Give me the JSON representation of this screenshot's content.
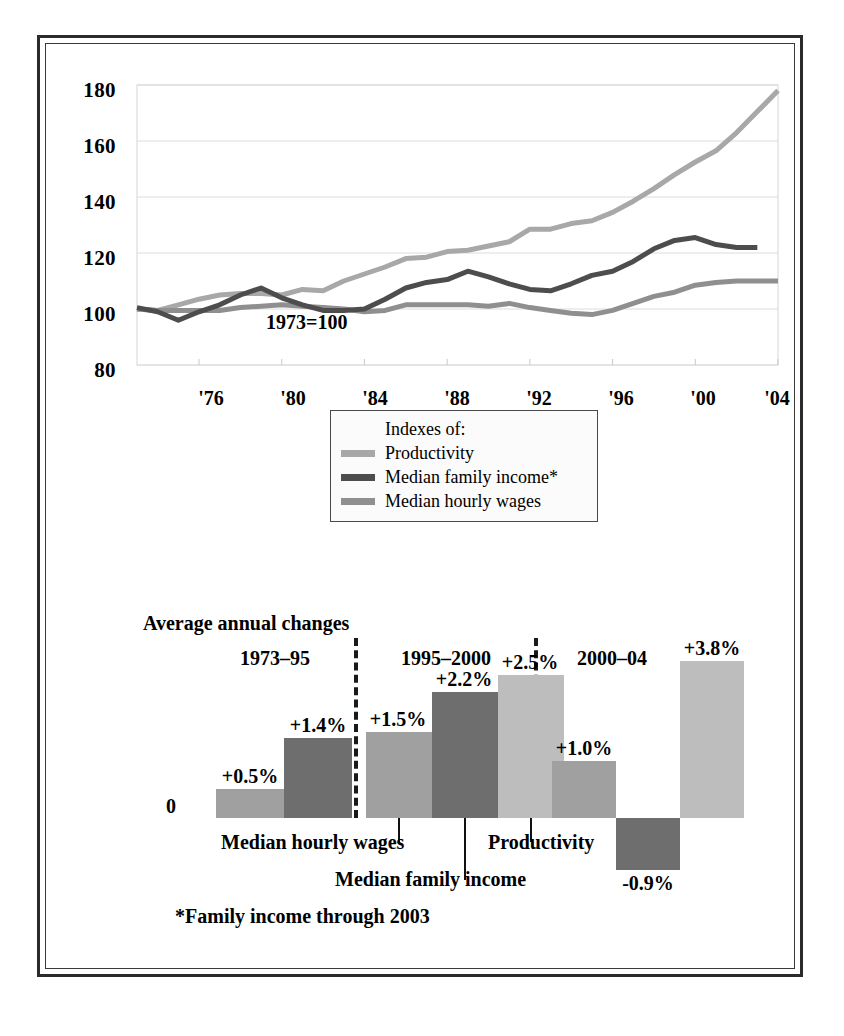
{
  "figure": {
    "note_index_base": "1973=100",
    "footnote": "*Family income through 2003"
  },
  "line_chart": {
    "y_ticks": [
      "180",
      "160",
      "140",
      "120",
      "100",
      "80"
    ],
    "x_ticks": [
      "'76",
      "'80",
      "'84",
      "'88",
      "'92",
      "'96",
      "'00",
      "'04"
    ],
    "legend": {
      "title": "Indexes of:",
      "items": [
        {
          "label": "Productivity",
          "color": "#a8a8a8"
        },
        {
          "label": "Median family income*",
          "color": "#4d4d4d"
        },
        {
          "label": "Median hourly wages",
          "color": "#8f8f8f"
        }
      ]
    }
  },
  "bar_chart": {
    "title": "Average annual changes",
    "zero_label": "0",
    "periods": [
      {
        "label": "1973–95"
      },
      {
        "label": "1995–2000"
      },
      {
        "label": "2000–04"
      }
    ],
    "series_labels": [
      {
        "text": "Median hourly wages"
      },
      {
        "text": "Median family income"
      },
      {
        "text": "Productivity"
      }
    ],
    "values": [
      "+0.5%",
      "+1.4%",
      "+1.5%",
      "+2.2%",
      "+2.5%",
      "+1.0%",
      "-0.9%",
      "+3.8%"
    ]
  },
  "colors": {
    "productivity": "#bdbdbd",
    "median_family_income": "#6e6e6e",
    "median_hourly_wages": "#a0a0a0",
    "frame": "#2b2b2b",
    "gridline": "#dcdcdc",
    "text": "#000000"
  },
  "chart_data": [
    {
      "type": "line",
      "title": "",
      "subtitle": "1973=100",
      "xlabel": "",
      "ylabel": "",
      "xlim": [
        1973,
        2004
      ],
      "ylim": [
        80,
        180
      ],
      "yticks": [
        80,
        100,
        120,
        140,
        160,
        180
      ],
      "xticks": [
        1976,
        1980,
        1984,
        1988,
        1992,
        1996,
        2000,
        2004
      ],
      "grid": true,
      "legend_position": "below-center",
      "x": [
        1973,
        1974,
        1975,
        1976,
        1977,
        1978,
        1979,
        1980,
        1981,
        1982,
        1983,
        1984,
        1985,
        1986,
        1987,
        1988,
        1989,
        1990,
        1991,
        1992,
        1993,
        1994,
        1995,
        1996,
        1997,
        1998,
        1999,
        2000,
        2001,
        2002,
        2003,
        2004
      ],
      "series": [
        {
          "name": "Productivity",
          "color": "#a8a8a8",
          "values": [
            100,
            99.5,
            101.5,
            103.5,
            105,
            105.5,
            105.5,
            105,
            107,
            106.5,
            110,
            112.5,
            115,
            118,
            118.5,
            120.5,
            121,
            122.5,
            124,
            128.5,
            128.5,
            130.5,
            131.5,
            134.5,
            138.5,
            143,
            148,
            152.5,
            156.5,
            163,
            170.5,
            178
          ]
        },
        {
          "name": "Median family income*",
          "color": "#4d4d4d",
          "values": [
            100.5,
            99,
            96,
            99,
            101.5,
            105,
            107.5,
            104,
            101.5,
            99.5,
            99.5,
            100,
            103.5,
            107.5,
            109.5,
            110.5,
            113.5,
            111.5,
            109,
            107,
            106.5,
            109,
            112,
            113.5,
            117,
            121.5,
            124.5,
            125.5,
            123,
            122,
            122,
            null
          ]
        },
        {
          "name": "Median hourly wages",
          "color": "#8f8f8f",
          "values": [
            100,
            99.5,
            99.5,
            99.5,
            99.5,
            100.5,
            101,
            101.5,
            101,
            100.5,
            100,
            99,
            99.5,
            101.5,
            101.5,
            101.5,
            101.5,
            101,
            102,
            100.5,
            99.5,
            98.5,
            98,
            99.5,
            102,
            104.5,
            106,
            108.5,
            109.5,
            110,
            110,
            110
          ]
        }
      ]
    },
    {
      "type": "bar",
      "title": "Average annual changes",
      "xlabel": "",
      "ylabel": "",
      "ylim": [
        -1.0,
        4.0
      ],
      "grid": false,
      "groups": [
        {
          "period": "1973–95",
          "bars": [
            {
              "name": "Median hourly wages",
              "value": 0.5,
              "label": "+0.5%",
              "color": "#a0a0a0"
            },
            {
              "name": "Median family income",
              "value": 1.4,
              "label": "+1.4%",
              "color": "#6e6e6e"
            }
          ]
        },
        {
          "period": "1995–2000",
          "bars": [
            {
              "name": "Median hourly wages",
              "value": 1.5,
              "label": "+1.5%",
              "color": "#a0a0a0"
            },
            {
              "name": "Median family income",
              "value": 2.2,
              "label": "+2.2%",
              "color": "#6e6e6e"
            },
            {
              "name": "Productivity",
              "value": 2.5,
              "label": "+2.5%",
              "color": "#bdbdbd"
            }
          ]
        },
        {
          "period": "2000–04",
          "bars": [
            {
              "name": "Median hourly wages",
              "value": 1.0,
              "label": "+1.0%",
              "color": "#a0a0a0"
            },
            {
              "name": "Median family income",
              "value": -0.9,
              "label": "-0.9%",
              "color": "#6e6e6e"
            },
            {
              "name": "Productivity",
              "value": 3.8,
              "label": "+3.8%",
              "color": "#bdbdbd"
            }
          ]
        }
      ]
    }
  ]
}
